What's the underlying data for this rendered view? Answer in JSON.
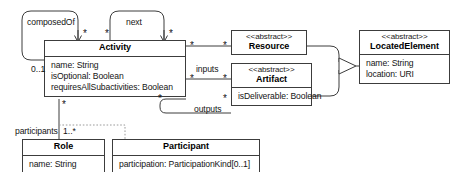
{
  "diagram": {
    "type": "uml-class-diagram",
    "width": 469,
    "height": 172,
    "background_color": "#ffffff",
    "line_color": "#3c3c3c",
    "text_color": "#141414"
  },
  "classes": {
    "activity": {
      "name": "Activity",
      "stereotype": "",
      "attributes": [
        "name: String",
        "isOptional: Boolean",
        "requiresAllSubactivities: Boolean"
      ]
    },
    "resource": {
      "name": "Resource",
      "stereotype": "<<abstract>>",
      "attributes": []
    },
    "artifact": {
      "name": "Artifact",
      "stereotype": "<<abstract>>",
      "attributes": [
        "isDeliverable: Boolean"
      ]
    },
    "located_element": {
      "name": "LocatedElement",
      "stereotype": "<<abstract>>",
      "attributes": [
        "name: String",
        "location: URI"
      ]
    },
    "role": {
      "name": "Role",
      "stereotype": "",
      "attributes": [
        "name: String"
      ]
    },
    "participant": {
      "name": "Participant",
      "stereotype": "",
      "attributes": [
        "participation: ParticipationKind[0..1]"
      ]
    }
  },
  "associations": {
    "composed_of": {
      "label": "composedOf",
      "source_multiplicity": "0..1",
      "target_multiplicity": "*",
      "kind": "composition"
    },
    "next": {
      "label": "next",
      "source_multiplicity": "*",
      "target_multiplicity": "*",
      "kind": "association"
    },
    "resource_link": {
      "label": "",
      "source_multiplicity": "*",
      "target_multiplicity": "*",
      "kind": "association"
    },
    "inputs": {
      "label": "inputs",
      "source_multiplicity": "*",
      "target_multiplicity": "*",
      "kind": "association"
    },
    "outputs": {
      "label": "outputs",
      "source_multiplicity": "*",
      "target_multiplicity": "*",
      "kind": "association"
    },
    "participants": {
      "label": "participants",
      "source_multiplicity": "*",
      "target_multiplicity": "1..*",
      "kind": "association-class"
    },
    "generalization_resource": {
      "label": "",
      "kind": "generalization"
    },
    "generalization_artifact": {
      "label": "",
      "kind": "generalization"
    }
  },
  "multiplicity_marks": {
    "composed_of_star": "*",
    "next_left_star": "*",
    "next_right_star": "*",
    "activity_resource_star": "*",
    "resource_end_star": "*",
    "activity_inputs_star": "*",
    "artifact_inputs_star": "*",
    "activity_outputs_star": "*",
    "artifact_outputs_star": "*",
    "activity_participants_star": "*",
    "role_end_mult": "1..*",
    "composition_end_mult": "0..1"
  }
}
